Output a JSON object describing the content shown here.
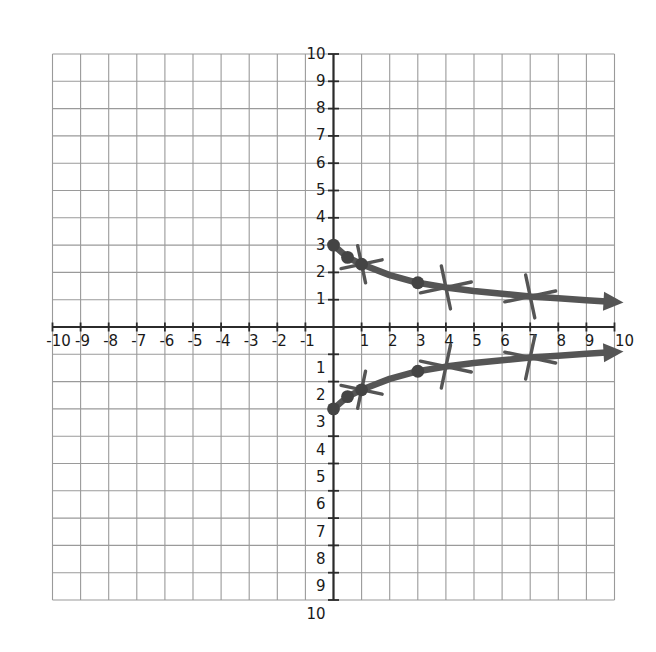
{
  "chart_data": {
    "type": "line",
    "title": "",
    "subtitle": "",
    "xlabel": "",
    "ylabel": "",
    "xlim": [
      -10,
      10
    ],
    "ylim": [
      -10,
      10
    ],
    "grid": true,
    "grid_step": 1,
    "legend": "none",
    "axis_style": "cartesian-four-quadrant",
    "x_tick_labels_positive": [
      "1",
      "2",
      "3",
      "4",
      "5",
      "6",
      "7",
      "8",
      "9",
      "10"
    ],
    "x_tick_labels_negative": [
      "-10",
      "-9",
      "-8",
      "-7",
      "-6",
      "-5",
      "-4",
      "-3",
      "-2",
      "-1"
    ],
    "y_tick_labels_positive": [
      "1",
      "2",
      "3",
      "4",
      "5",
      "6",
      "7",
      "8",
      "9",
      "10"
    ],
    "y_tick_labels_negative": [
      "1",
      "2",
      "3",
      "4",
      "5",
      "6",
      "7",
      "8",
      "9",
      "10"
    ],
    "series": [
      {
        "name": "upper-branch",
        "style": "thick-line-with-arrow",
        "color": "#555555",
        "arrow_end": "right",
        "points": [
          {
            "x": 0.0,
            "y": 3.0
          },
          {
            "x": 0.5,
            "y": 2.55
          },
          {
            "x": 1.0,
            "y": 2.3
          },
          {
            "x": 2.0,
            "y": 1.9
          },
          {
            "x": 3.0,
            "y": 1.62
          },
          {
            "x": 4.0,
            "y": 1.45
          },
          {
            "x": 5.0,
            "y": 1.32
          },
          {
            "x": 6.0,
            "y": 1.22
          },
          {
            "x": 7.0,
            "y": 1.12
          },
          {
            "x": 8.0,
            "y": 1.05
          },
          {
            "x": 9.0,
            "y": 0.98
          },
          {
            "x": 10.0,
            "y": 0.92
          }
        ],
        "marked_points": [
          {
            "x": 0.0,
            "y": 3.0
          },
          {
            "x": 0.5,
            "y": 2.55
          },
          {
            "x": 1.0,
            "y": 2.3
          },
          {
            "x": 3.0,
            "y": 1.62
          }
        ],
        "cross_ticks": [
          {
            "x": 1.0,
            "y": 2.3
          },
          {
            "x": 4.0,
            "y": 1.45
          },
          {
            "x": 7.0,
            "y": 1.12
          }
        ]
      },
      {
        "name": "lower-branch",
        "style": "thick-line-with-arrow",
        "color": "#555555",
        "arrow_end": "right",
        "points": [
          {
            "x": 0.0,
            "y": -3.0
          },
          {
            "x": 0.5,
            "y": -2.55
          },
          {
            "x": 1.0,
            "y": -2.3
          },
          {
            "x": 2.0,
            "y": -1.9
          },
          {
            "x": 3.0,
            "y": -1.62
          },
          {
            "x": 4.0,
            "y": -1.45
          },
          {
            "x": 5.0,
            "y": -1.32
          },
          {
            "x": 6.0,
            "y": -1.22
          },
          {
            "x": 7.0,
            "y": -1.12
          },
          {
            "x": 8.0,
            "y": -1.05
          },
          {
            "x": 9.0,
            "y": -0.98
          },
          {
            "x": 10.0,
            "y": -0.92
          }
        ],
        "marked_points": [
          {
            "x": 0.0,
            "y": -3.0
          },
          {
            "x": 0.5,
            "y": -2.55
          },
          {
            "x": 1.0,
            "y": -2.3
          },
          {
            "x": 3.0,
            "y": -1.62
          }
        ],
        "cross_ticks": [
          {
            "x": 1.0,
            "y": -2.3
          },
          {
            "x": 4.0,
            "y": -1.45
          },
          {
            "x": 7.0,
            "y": -1.12
          }
        ]
      }
    ],
    "colors": {
      "grid": "#9a9a9a",
      "axis": "#2b2b2b",
      "curve": "#555555",
      "marker": "#444444",
      "label": "#1a1a1a",
      "background": "#ffffff"
    }
  }
}
